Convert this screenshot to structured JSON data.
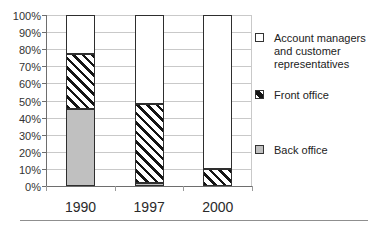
{
  "chart_data": {
    "type": "bar",
    "subtype": "stacked-100-percent",
    "title": "",
    "categories": [
      "1990",
      "1997",
      "2000"
    ],
    "series": [
      {
        "name": "Back office",
        "pattern": "solid-gray",
        "values": [
          45,
          2,
          0
        ]
      },
      {
        "name": "Front office",
        "pattern": "diagonal-hatch",
        "values": [
          32,
          46,
          10
        ]
      },
      {
        "name": "Account managers and customer representatives",
        "pattern": "solid-white",
        "values": [
          23,
          52,
          90
        ]
      }
    ],
    "xlabel": "",
    "ylabel": "",
    "ylim": [
      0,
      100
    ],
    "ytick_step": 10,
    "ytick_labels": [
      "100%",
      "90%",
      "80%",
      "70%",
      "60%",
      "50%",
      "40%",
      "30%",
      "20%",
      "10%",
      "0%"
    ],
    "grid": true,
    "legend_position": "right"
  },
  "legend": {
    "items": [
      {
        "label": "Account managers and customer representatives",
        "swatch": "white-square"
      },
      {
        "label": "Front office",
        "swatch": "diagonal-hatch-square"
      },
      {
        "label": "Back office",
        "swatch": "gray-square"
      }
    ]
  },
  "colors": {
    "back_office_fill": "#c0c0c0",
    "hatch_stroke": "#141414",
    "bar_border": "#2e2e2e",
    "gridline": "#c9c9c9",
    "axis": "#6e6e6e",
    "text": "#1c1c1c"
  }
}
